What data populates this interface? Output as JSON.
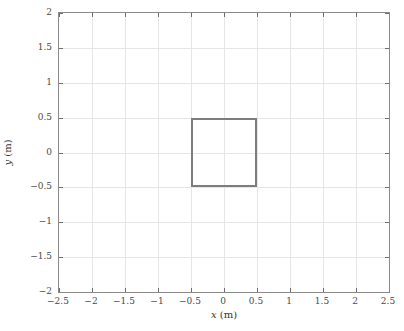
{
  "chart_data": {
    "type": "line",
    "title": "",
    "xlabel": "x (m)",
    "ylabel": "y (m)",
    "xlabel_var": "x",
    "xlabel_unit": "(m)",
    "ylabel_var": "y",
    "ylabel_unit": "(m)",
    "xlim": [
      -2.5,
      2.5
    ],
    "ylim": [
      -2,
      2
    ],
    "xticks": [
      -2.5,
      -2,
      -1.5,
      -1,
      -0.5,
      0,
      0.5,
      1,
      1.5,
      2,
      2.5
    ],
    "xticklabels": [
      "−2.5",
      "−2",
      "−1.5",
      "−1",
      "−0.5",
      "0",
      "0.5",
      "1",
      "1.5",
      "2",
      "2.5"
    ],
    "yticks": [
      -2,
      -1.5,
      -1,
      -0.5,
      0,
      0.5,
      1,
      1.5,
      2
    ],
    "yticklabels": [
      "−2",
      "−1.5",
      "−1",
      "−0.5",
      "0",
      "0.5",
      "1",
      "1.5",
      "2"
    ],
    "grid": true,
    "grid_color": "#e6e6e6",
    "legend": null,
    "axes_color": "#8a8a8a",
    "series": [
      {
        "name": "square-path",
        "color": "#7d7d7d",
        "linewidth": 2,
        "closed": true,
        "x": [
          -0.5,
          0.5,
          0.5,
          -0.5,
          -0.5
        ],
        "y": [
          0.5,
          0.5,
          -0.5,
          -0.5,
          0.5
        ]
      }
    ],
    "annotations": []
  }
}
